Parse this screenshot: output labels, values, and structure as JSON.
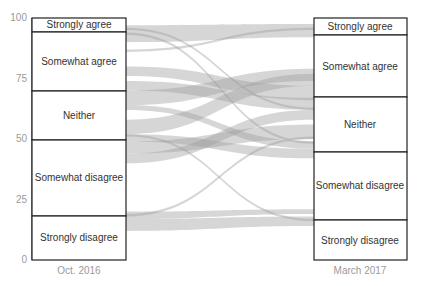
{
  "chart_data": {
    "type": "alluvial",
    "title": "",
    "ylabel": "",
    "ylim": [
      0,
      100
    ],
    "yticks": [
      0,
      25,
      50,
      75,
      100
    ],
    "columns": [
      {
        "label": "Oct. 2016",
        "categories": [
          {
            "name": "Strongly agree",
            "start": 94,
            "end": 100
          },
          {
            "name": "Somewhat agree",
            "start": 70,
            "end": 94
          },
          {
            "name": "Neither",
            "start": 50,
            "end": 70
          },
          {
            "name": "Somewhat disagree",
            "start": 18,
            "end": 50
          },
          {
            "name": "Strongly disagree",
            "start": 0,
            "end": 18
          }
        ]
      },
      {
        "label": "March 2017",
        "categories": [
          {
            "name": "Strongly agree",
            "start": 93,
            "end": 100
          },
          {
            "name": "Somewhat agree",
            "start": 67,
            "end": 93
          },
          {
            "name": "Neither",
            "start": 44,
            "end": 67
          },
          {
            "name": "Somewhat disagree",
            "start": 16,
            "end": 44
          },
          {
            "name": "Strongly disagree",
            "start": 0,
            "end": 16
          }
        ]
      }
    ],
    "flows": [
      {
        "from": [
          90,
          97
        ],
        "to": [
          92,
          97.5
        ]
      },
      {
        "from": [
          95,
          96
        ],
        "to": [
          62,
          63
        ]
      },
      {
        "from": [
          93,
          94
        ],
        "to": [
          48,
          49
        ]
      },
      {
        "from": [
          86,
          87
        ],
        "to": [
          95,
          96
        ]
      },
      {
        "from": [
          76,
          80
        ],
        "to": [
          66,
          72
        ]
      },
      {
        "from": [
          70,
          74
        ],
        "to": [
          62,
          67
        ]
      },
      {
        "from": [
          64,
          70
        ],
        "to": [
          74,
          79
        ]
      },
      {
        "from": [
          62,
          64
        ],
        "to": [
          46,
          49
        ]
      },
      {
        "from": [
          52,
          58
        ],
        "to": [
          72,
          77
        ]
      },
      {
        "from": [
          49,
          52
        ],
        "to": [
          42,
          46
        ]
      },
      {
        "from": [
          44,
          49
        ],
        "to": [
          50,
          56
        ]
      },
      {
        "from": [
          40,
          44
        ],
        "to": [
          58,
          62
        ]
      },
      {
        "from": [
          51,
          52
        ],
        "to": [
          16,
          17
        ]
      },
      {
        "from": [
          18,
          19
        ],
        "to": [
          50,
          51
        ]
      },
      {
        "from": [
          12,
          17
        ],
        "to": [
          14,
          18
        ]
      },
      {
        "from": [
          17,
          20
        ],
        "to": [
          19,
          21
        ]
      }
    ]
  },
  "yaxis": {
    "ticks": [
      "100",
      "75",
      "50",
      "25",
      "0"
    ]
  },
  "left": {
    "label": "Oct. 2016",
    "cats": [
      "Strongly agree",
      "Somewhat agree",
      "Neither",
      "Somewhat disagree",
      "Strongly disagree"
    ]
  },
  "right": {
    "label": "March 2017",
    "cats": [
      "Strongly agree",
      "Somewhat agree",
      "Neither",
      "Somewhat disagree",
      "Strongly disagree"
    ]
  }
}
